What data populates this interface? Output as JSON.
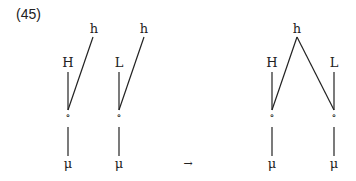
{
  "example_number": "(45)",
  "diagrams": {
    "left_1": {
      "tone": "H",
      "upper": "h",
      "node": "∘",
      "mora": "μ"
    },
    "left_2": {
      "tone": "L",
      "upper": "h",
      "node": "∘",
      "mora": "μ"
    },
    "right": {
      "tone_left": "H",
      "upper": "h",
      "tone_right": "L",
      "node_left": "∘",
      "node_right": "∘",
      "mora_left": "μ",
      "mora_right": "μ"
    }
  },
  "arrow": "→"
}
